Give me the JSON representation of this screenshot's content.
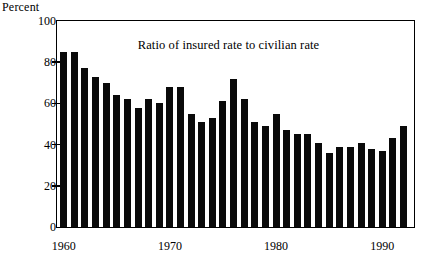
{
  "axis_unit_label": "Percent",
  "chart_data": {
    "type": "bar",
    "title": "Ratio of insured rate to civilian rate",
    "xlabel": "",
    "ylabel": "Percent",
    "ylim": [
      0,
      100
    ],
    "yticks": [
      0,
      20,
      40,
      60,
      80,
      100
    ],
    "xticks": [
      1960,
      1970,
      1980,
      1990
    ],
    "grid": false,
    "legend": null,
    "bar_color": "#0a0a0a",
    "categories": [
      1960,
      1961,
      1962,
      1963,
      1964,
      1965,
      1966,
      1967,
      1968,
      1969,
      1970,
      1971,
      1972,
      1973,
      1974,
      1975,
      1976,
      1977,
      1978,
      1979,
      1980,
      1981,
      1982,
      1983,
      1984,
      1985,
      1986,
      1987,
      1988,
      1989,
      1990,
      1991,
      1992
    ],
    "values": [
      85,
      85,
      77,
      73,
      70,
      64,
      62,
      58,
      62,
      60,
      68,
      68,
      55,
      51,
      53,
      61,
      72,
      62,
      51,
      49,
      55,
      47,
      45,
      45,
      41,
      36,
      39,
      39,
      41,
      38,
      37,
      43,
      49
    ]
  }
}
